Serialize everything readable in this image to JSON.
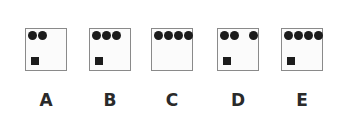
{
  "panels": [
    {
      "label": "A",
      "left": 25,
      "dots": [
        2,
        12
      ],
      "square": true
    },
    {
      "label": "B",
      "left": 89,
      "dots": [
        2,
        12,
        22
      ],
      "square": true
    },
    {
      "label": "C",
      "left": 151,
      "dots": [
        2,
        12,
        22,
        32
      ],
      "square": false
    },
    {
      "label": "D",
      "left": 217,
      "dots": [
        2,
        12,
        31
      ],
      "square": true
    },
    {
      "label": "E",
      "left": 281,
      "dots": [
        2,
        12,
        22,
        32
      ],
      "square": true
    }
  ]
}
